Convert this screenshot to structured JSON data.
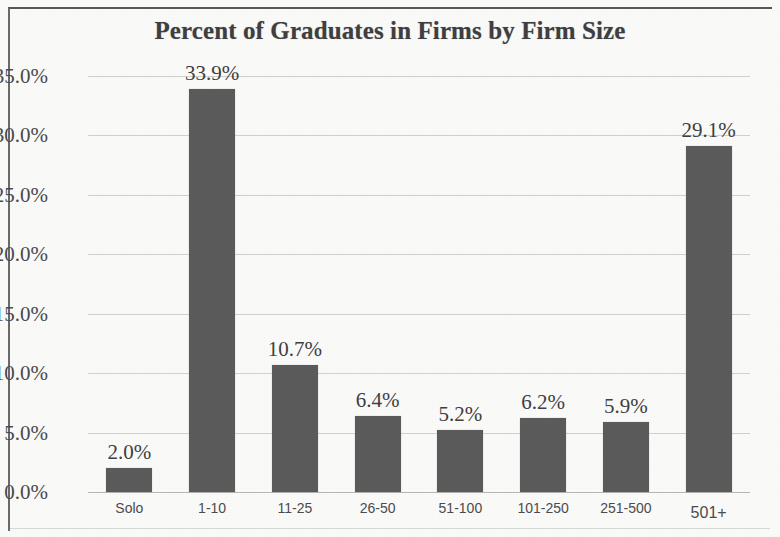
{
  "chart_data": {
    "type": "bar",
    "title": "Percent of Graduates in Firms by Firm Size",
    "xlabel": "",
    "ylabel": "",
    "categories": [
      "Solo",
      "1-10",
      "11-25",
      "26-50",
      "51-100",
      "101-250",
      "251-500",
      "501+"
    ],
    "values": [
      2.0,
      33.9,
      10.7,
      6.4,
      5.2,
      6.2,
      5.9,
      29.1
    ],
    "value_labels": [
      "2.0%",
      "33.9%",
      "10.7%",
      "6.4%",
      "5.2%",
      "6.2%",
      "5.9%",
      "29.1%"
    ],
    "ylim": [
      0,
      35
    ],
    "ytick_values": [
      35.0,
      30.0,
      25.0,
      20.0,
      15.0,
      10.0,
      5.0,
      0.0
    ],
    "ytick_labels": [
      "35.0%",
      "30.0%",
      "25.0%",
      "20.0%",
      "15.0%",
      "10.0%",
      "5.0%",
      "0.0%"
    ],
    "grid": true,
    "legend": false,
    "series_color": "#5b5b5b",
    "gridline_color": "#cfcfcd",
    "text_color": "#3f3f41"
  }
}
